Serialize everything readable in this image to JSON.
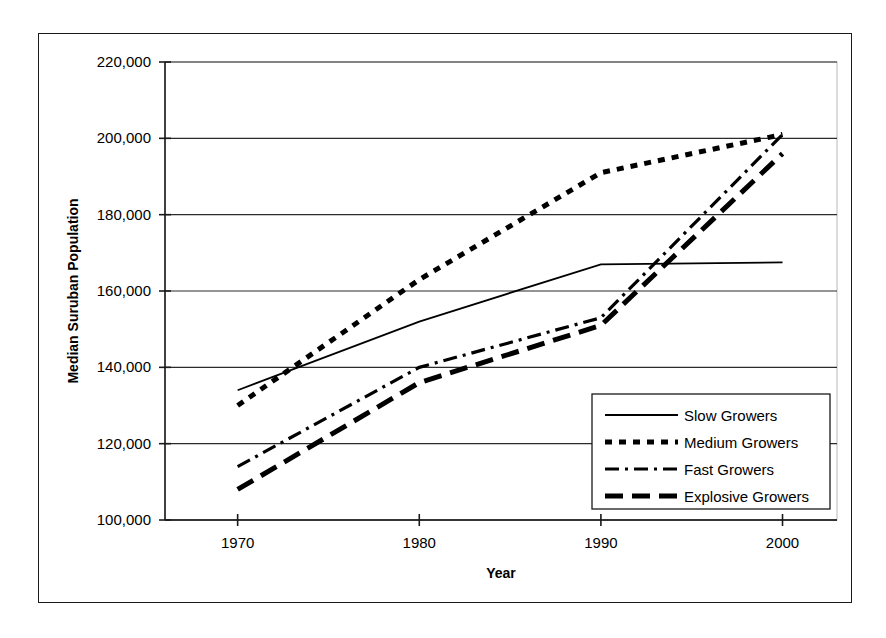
{
  "chart_data": {
    "type": "line",
    "title": "",
    "xlabel": "Year",
    "ylabel": "Median Suruban Population",
    "x": [
      1970,
      1980,
      1990,
      2000
    ],
    "xticklabels": [
      "1970",
      "1980",
      "1990",
      "2000"
    ],
    "xlim": [
      1966,
      2003
    ],
    "ylim": [
      100000,
      220000
    ],
    "yticklabels": [
      "100,000",
      "120,000",
      "140,000",
      "160,000",
      "180,000",
      "200,000",
      "220,000"
    ],
    "yticks": [
      100000,
      120000,
      140000,
      160000,
      180000,
      200000,
      220000
    ],
    "grid": "horizontal",
    "legend_position": "lower-right-inside",
    "series": [
      {
        "name": "Slow Growers",
        "style": "solid",
        "color": "#000000",
        "values": [
          134000,
          152000,
          167000,
          167500
        ]
      },
      {
        "name": "Medium Growers",
        "style": "dotted",
        "color": "#000000",
        "values": [
          130000,
          163000,
          191000,
          201000
        ]
      },
      {
        "name": "Fast Growers",
        "style": "dash-dot",
        "color": "#000000",
        "values": [
          114000,
          140000,
          153000,
          201000
        ]
      },
      {
        "name": "Explosive Growers",
        "style": "long-dash",
        "color": "#000000",
        "values": [
          108000,
          136000,
          151000,
          196000
        ]
      }
    ]
  },
  "axis": {
    "y_title": "Median Suruban Population",
    "x_title": "Year",
    "ytick_0": "100,000",
    "ytick_1": "120,000",
    "ytick_2": "140,000",
    "ytick_3": "160,000",
    "ytick_4": "180,000",
    "ytick_5": "200,000",
    "ytick_6": "220,000",
    "xtick_0": "1970",
    "xtick_1": "1980",
    "xtick_2": "1990",
    "xtick_3": "2000"
  },
  "legend": {
    "entries": [
      {
        "label": "Slow Growers",
        "style": "solid"
      },
      {
        "label": "Medium Growers",
        "style": "dotted"
      },
      {
        "label": "Fast Growers",
        "style": "dash-dot"
      },
      {
        "label": "Explosive Growers",
        "style": "long-dash"
      }
    ]
  }
}
